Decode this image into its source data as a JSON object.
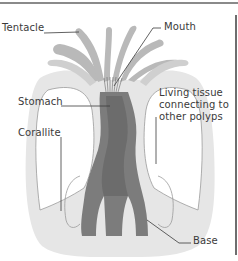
{
  "diagram": {
    "colors": {
      "background": "#ffffff",
      "body_fill": "#e6e6e6",
      "tentacle_fill": "#b9b9b9",
      "stomach_fill": "#7c7c7c",
      "stomach_dark": "#5f5f5f",
      "outline": "#8f8f8f",
      "leader_line": "#3a3a3a",
      "label_text": "#3a3a3a",
      "frame_line": "#8a8a8a"
    },
    "labels": {
      "tentacle": "Tentacle",
      "mouth": "Mouth",
      "stomach": "Stomach",
      "living_tissue": [
        "Living tissue",
        "connecting to",
        "other polyps"
      ],
      "corallite": "Corallite",
      "base": "Base"
    }
  }
}
